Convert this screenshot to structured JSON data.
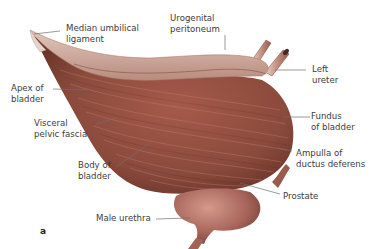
{
  "figure": {
    "panel_letter": "a",
    "colors": {
      "muscle": "#8a4a3c",
      "muscle_dark": "#5e2c22",
      "muscle_light": "#b8786a",
      "peritoneum": "#c9a596",
      "prostate": "#a7645a",
      "leader_line": "#6e6e6e",
      "text": "#3c3c3c"
    },
    "labels": {
      "median_umbilical_ligament": "Median umbilical\nligament",
      "urogenital_peritoneum": "Urogenital\nperitoneum",
      "left_ureter": "Left\nureter",
      "apex_of_bladder": "Apex of\nbladder",
      "fundus_of_bladder": "Fundus\nof bladder",
      "visceral_pelvic_fascia": "Visceral\npelvic fascia",
      "body_of_bladder": "Body of\nbladder",
      "ampulla_of_ductus_deferens": "Ampulla of\nductus deferens",
      "prostate": "Prostate",
      "male_urethra": "Male urethra"
    }
  }
}
